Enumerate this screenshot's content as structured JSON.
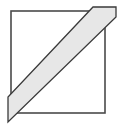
{
  "figure": {
    "title": "Square with diagonal band",
    "width": 122,
    "height": 128,
    "background_color": "#ffffff",
    "shapes": {
      "square": {
        "name": "square-outline",
        "stroke_color": "#4a4a4a",
        "stroke_width": 1.6,
        "fill_color": "none",
        "x": 11,
        "y": 11,
        "width": 94,
        "height": 102,
        "corners": [
          [
            11,
            11
          ],
          [
            105,
            11
          ],
          [
            105,
            113
          ],
          [
            11,
            113
          ]
        ]
      },
      "band": {
        "name": "diagonal-band",
        "fill_color": "#e7e7e7",
        "stroke_color": "#3a3a3a",
        "stroke_width": 1.3,
        "direction": "lower-left-to-upper-right",
        "points": [
          [
            8,
            97
          ],
          [
            8,
            122
          ],
          [
            116,
            17
          ],
          [
            116,
            7
          ],
          [
            93,
            7
          ]
        ],
        "overhang_left": true,
        "overhang_top_right": true
      }
    },
    "labels": []
  }
}
